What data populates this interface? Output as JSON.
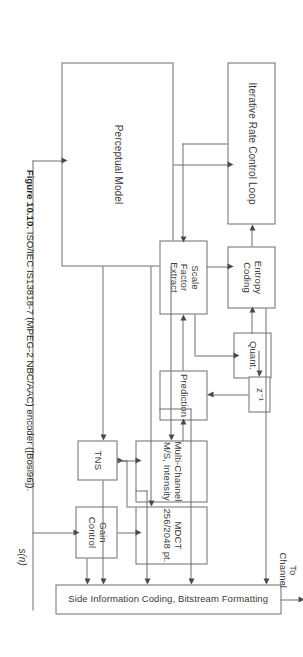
{
  "figure": {
    "number": "Figure 10.10.",
    "caption": "ISO/IEC IS13818-7 (MPEG-2 NBC/AAC) encoder ([Bosi96])."
  },
  "diagram": {
    "type": "block-diagram",
    "orientation": "rotated-90-clockwise-on-page",
    "blocks": [
      {
        "id": "perceptual",
        "label": "Perceptual Model"
      },
      {
        "id": "iterative",
        "label": "Iterative Rate Control Loop"
      },
      {
        "id": "entropy",
        "label": "Entropy\nCoding"
      },
      {
        "id": "quant",
        "label": "Quant."
      },
      {
        "id": "scale",
        "label": "Scale\nFactor\nExtract"
      },
      {
        "id": "zinv",
        "label": "z⁻¹"
      },
      {
        "id": "prediction",
        "label": "Prediction"
      },
      {
        "id": "multichannel",
        "label": "Multi-Channel\nM/S, Intensity"
      },
      {
        "id": "tns",
        "label": "TNS"
      },
      {
        "id": "mdct",
        "label": "MDCT\n256/2048 pt."
      },
      {
        "id": "gain",
        "label": "Gain\nControl"
      },
      {
        "id": "side",
        "label": "Side Information Coding, Bitstream Formatting"
      }
    ],
    "annotations": [
      {
        "id": "to-channel",
        "label": "To\nChannel"
      },
      {
        "id": "input-signal",
        "label": "s(n)"
      }
    ]
  }
}
